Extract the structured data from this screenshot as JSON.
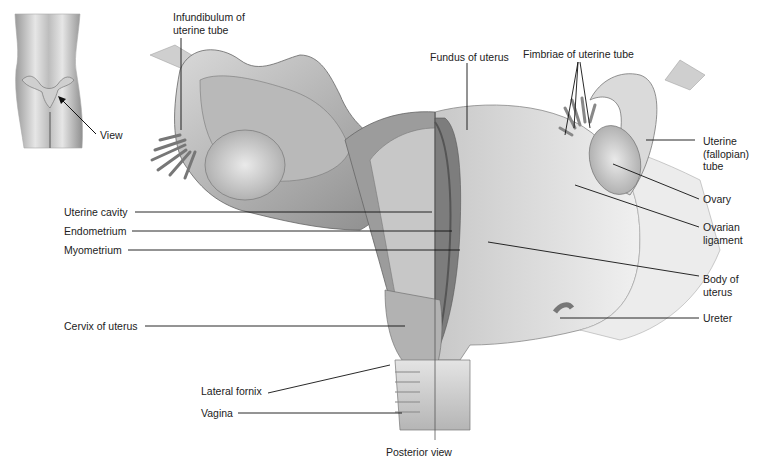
{
  "figure": {
    "caption": "Posterior view",
    "inset_label": "View"
  },
  "labels": {
    "infundibulum": "Infundibulum of\nuterine tube",
    "fimbriae": "Fimbriae of uterine tube",
    "fundus": "Fundus of uterus",
    "uterine_tube": "Uterine\n(fallopian)\ntube",
    "ovary": "Ovary",
    "ovarian_ligament": "Ovarian\nligament",
    "body": "Body of\nuterus",
    "ureter": "Ureter",
    "uterine_cavity": "Uterine cavity",
    "endometrium": "Endometrium",
    "myometrium": "Myometrium",
    "cervix": "Cervix of uterus",
    "lateral_fornix": "Lateral fornix",
    "vagina": "Vagina"
  }
}
